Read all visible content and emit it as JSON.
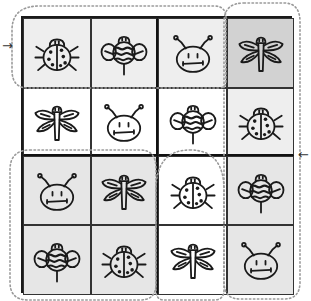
{
  "puzzle": {
    "type": "4x4 bug sudoku",
    "colors": {
      "white": "#ffffff",
      "light": "#eeeeee",
      "gray": "#e6e6e6",
      "dark": "#d2d2d2",
      "ink": "#1a1a1a"
    },
    "rows": [
      [
        {
          "bug": "ladybug",
          "shade": "light"
        },
        {
          "bug": "bee",
          "shade": "light"
        },
        {
          "bug": "antenna-face",
          "shade": "light"
        },
        {
          "bug": "dragonfly",
          "shade": "dark"
        }
      ],
      [
        {
          "bug": "dragonfly",
          "shade": "white"
        },
        {
          "bug": "antenna-face",
          "shade": "white"
        },
        {
          "bug": "bee",
          "shade": "white"
        },
        {
          "bug": "ladybug",
          "shade": "light"
        }
      ],
      [
        {
          "bug": "antenna-face",
          "shade": "gray"
        },
        {
          "bug": "dragonfly",
          "shade": "gray"
        },
        {
          "bug": "ladybug",
          "shade": "white"
        },
        {
          "bug": "bee",
          "shade": "gray"
        }
      ],
      [
        {
          "bug": "bee",
          "shade": "gray"
        },
        {
          "bug": "ladybug",
          "shade": "gray"
        },
        {
          "bug": "dragonfly",
          "shade": "white"
        },
        {
          "bug": "antenna-face",
          "shade": "gray"
        }
      ]
    ]
  },
  "arrows": {
    "left": "→",
    "right": "←"
  }
}
